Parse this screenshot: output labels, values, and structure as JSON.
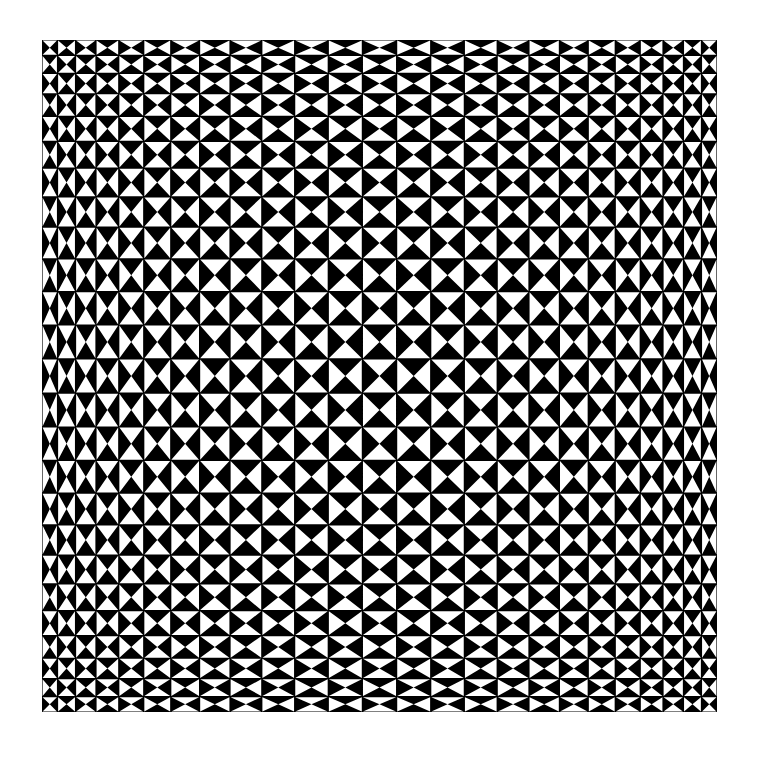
{
  "artwork": {
    "title": "Op-art hourglass checkerboard",
    "frame": {
      "x": 42,
      "y": 40,
      "width": 675,
      "height": 672
    },
    "grid": {
      "columns": 25,
      "rows": 25,
      "edge_to_center_scale": 2.4
    },
    "colors": {
      "background": "#ffffff",
      "ink": "#000000",
      "paper": "#ffffff"
    },
    "cell_pattern": "alternating hourglass: even cells have white top/bottom triangles, odd cells have white left/right triangles",
    "start_orientation": "vertical-white"
  }
}
